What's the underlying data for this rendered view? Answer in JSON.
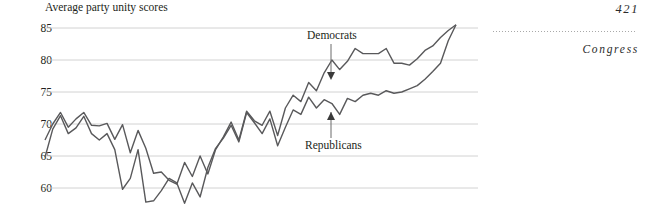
{
  "running_head": {
    "page_number": "421",
    "title": "Congress",
    "rule": "dotted-rule"
  },
  "figure": {
    "title": "Average party unity scores",
    "y_ticks": [
      "85",
      "80",
      "75",
      "70",
      "65",
      "60"
    ],
    "annotations": [
      {
        "label": "Democrats",
        "pointer": "arrow-down"
      },
      {
        "label": "Republicans",
        "pointer": "arrow-up"
      }
    ]
  },
  "chart_data": {
    "type": "line",
    "title": "Average party unity scores",
    "xlabel": "",
    "ylabel": "",
    "ylim": [
      57,
      86
    ],
    "yticks": [
      60,
      65,
      70,
      75,
      80,
      85
    ],
    "grid": true,
    "legend": "inline-annotations",
    "x": [
      1,
      2,
      3,
      4,
      5,
      6,
      7,
      8,
      9,
      10,
      11,
      12,
      13,
      14,
      15,
      16,
      17,
      18,
      19,
      20,
      21,
      22,
      23,
      24,
      25,
      26,
      27,
      28,
      29,
      30,
      31,
      32,
      33,
      34,
      35,
      36,
      37,
      38,
      39,
      40,
      41,
      42,
      43,
      44,
      45,
      46,
      47,
      48,
      49,
      50,
      51,
      52,
      53,
      54
    ],
    "series": [
      {
        "name": "Democrats",
        "color": "#59595b",
        "values": [
          67.5,
          70.0,
          71.8,
          69.5,
          70.8,
          71.8,
          69.8,
          69.7,
          70.1,
          67.6,
          69.9,
          65.5,
          69.0,
          66.2,
          62.3,
          62.5,
          61.2,
          60.6,
          64.0,
          61.8,
          65.0,
          62.2,
          66.0,
          68.0,
          70.3,
          67.5,
          72.0,
          70.5,
          69.8,
          72.0,
          68.2,
          72.5,
          74.5,
          73.5,
          76.5,
          75.2,
          78.0,
          80.0,
          78.5,
          79.8,
          81.8,
          81.0,
          81.0,
          81.0,
          81.8,
          79.5,
          79.5,
          79.2,
          80.2,
          81.5,
          82.2,
          83.5,
          84.6,
          85.5
        ]
      },
      {
        "name": "Republicans",
        "color": "#59595b",
        "values": [
          64.8,
          69.2,
          71.3,
          68.5,
          69.4,
          71.2,
          68.5,
          67.5,
          68.5,
          66.0,
          59.8,
          61.5,
          66.0,
          57.8,
          58.0,
          59.6,
          61.5,
          60.8,
          57.6,
          60.8,
          58.6,
          63.2,
          66.2,
          67.8,
          69.8,
          67.2,
          71.8,
          70.2,
          68.5,
          70.8,
          66.6,
          69.5,
          72.2,
          71.5,
          74.2,
          72.5,
          73.8,
          73.2,
          71.5,
          74.0,
          73.5,
          74.5,
          74.8,
          74.5,
          75.2,
          74.8,
          75.0,
          75.5,
          76.0,
          77.0,
          78.2,
          79.5,
          83.0,
          85.5
        ]
      }
    ]
  }
}
